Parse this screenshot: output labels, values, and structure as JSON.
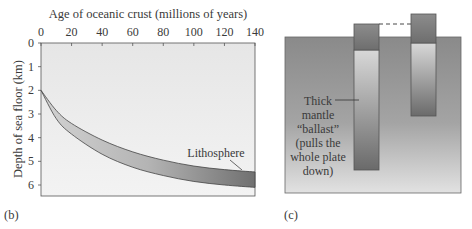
{
  "panel_b": {
    "label": "(b)",
    "annotation": "Lithosphere",
    "chart_data": {
      "type": "area",
      "title": "",
      "xlabel": "Age of oceanic crust (millions of years)",
      "ylabel": "Depth of sea floor (km)",
      "x_axis_position": "top",
      "y_inverted": true,
      "xlim": [
        0,
        140
      ],
      "ylim": [
        0,
        6.4
      ],
      "xticks": [
        0,
        20,
        40,
        60,
        80,
        100,
        120,
        140
      ],
      "yticks": [
        0,
        1,
        2,
        3,
        4,
        5,
        6
      ],
      "grid": false,
      "series": [
        {
          "name": "Lithosphere top (sea floor)",
          "x": [
            0,
            10,
            20,
            40,
            60,
            80,
            100,
            120,
            140
          ],
          "y": [
            2.0,
            2.85,
            3.4,
            4.1,
            4.6,
            4.95,
            5.2,
            5.35,
            5.45
          ]
        },
        {
          "name": "Lithosphere base",
          "x": [
            0,
            10,
            20,
            40,
            60,
            80,
            100,
            120,
            140
          ],
          "y": [
            2.0,
            3.2,
            3.85,
            4.7,
            5.25,
            5.6,
            5.85,
            6.0,
            6.1
          ]
        }
      ],
      "annotations": [
        "Lithosphere"
      ]
    }
  },
  "panel_c": {
    "label": "(c)",
    "annotation_lines": [
      "Thick",
      "mantle",
      "“ballast”",
      "(pulls the",
      "whole plate",
      "down)"
    ],
    "colors": {
      "mantle": "#8e8e8e",
      "crust": "#7c7c7c",
      "column_light": "#d4d4d4",
      "column_dark": "#6e6e6e"
    }
  }
}
